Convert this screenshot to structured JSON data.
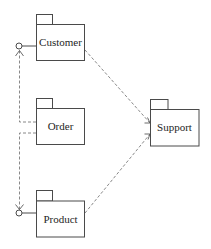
{
  "diagram": {
    "type": "uml-package-diagram",
    "colors": {
      "background": "#ffffff",
      "package_stroke": "#4a4a4a",
      "dependency_stroke": "#7a7a7a",
      "text": "#1e1e1e"
    },
    "packages": [
      {
        "id": "customer",
        "label": "Customer"
      },
      {
        "id": "order",
        "label": "Order"
      },
      {
        "id": "product",
        "label": "Product"
      },
      {
        "id": "support",
        "label": "Support"
      }
    ],
    "interfaces": [
      {
        "owner": "Customer",
        "kind": "provided-interface (lollipop)"
      },
      {
        "owner": "Product",
        "kind": "provided-interface (lollipop)"
      }
    ],
    "relationships": [
      {
        "from": "Customer",
        "to": "Support",
        "kind": "dependency",
        "style": "dashed, open arrow"
      },
      {
        "from": "Product",
        "to": "Support",
        "kind": "dependency",
        "style": "dashed, open arrow"
      },
      {
        "from": "Order",
        "to": "Customer",
        "kind": "interface usage",
        "style": "dashed, open arrow to lollipop"
      },
      {
        "from": "Order",
        "to": "Product",
        "kind": "interface usage",
        "style": "dashed, open arrow to lollipop"
      }
    ]
  }
}
